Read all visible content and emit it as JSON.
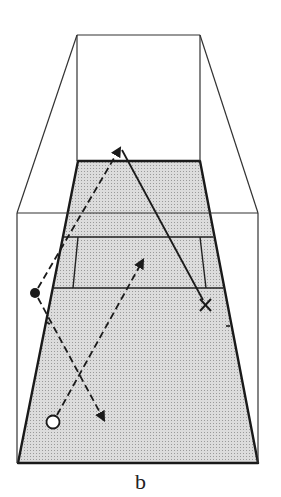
{
  "figure": {
    "caption": "b",
    "colors": {
      "line": "#1a1a1a",
      "court_fill": "#cfcfcf",
      "background": "#ffffff"
    },
    "room": {
      "back_wall": {
        "x1": 77,
        "y1": 35,
        "x2": 200,
        "y2": 35
      },
      "front_frame": {
        "left": 17,
        "top": 213,
        "right": 258,
        "bottom": 463
      }
    },
    "court": {
      "far_edge": {
        "left": 78,
        "right": 200,
        "y": 161
      },
      "near_edge": {
        "left": 18,
        "right": 258,
        "y": 463
      },
      "cross_lines_y": [
        213,
        237,
        288
      ],
      "service_box_sides": [
        [
          78,
          237,
          73,
          288
        ],
        [
          200,
          237,
          206,
          288
        ]
      ]
    },
    "players": [
      {
        "name": "filled-dot-player",
        "symbol": "●",
        "x": 35,
        "y": 293
      },
      {
        "name": "open-circle-player",
        "symbol": "○",
        "x": 53,
        "y": 422
      },
      {
        "name": "x-marker",
        "symbol": "X",
        "x": 205,
        "y": 305
      }
    ],
    "paths": [
      {
        "name": "dashed-path-dot-to-far",
        "style": "dashed",
        "from": [
          35,
          293
        ],
        "to": [
          120,
          148
        ]
      },
      {
        "name": "dashed-path-dot-to-near",
        "style": "dashed",
        "from": [
          35,
          293
        ],
        "to": [
          104,
          420
        ]
      },
      {
        "name": "dashed-path-circle-to-mid",
        "style": "dashed",
        "from": [
          53,
          422
        ],
        "to": [
          143,
          260
        ]
      },
      {
        "name": "solid-path-x-to-far",
        "style": "solid",
        "from": [
          205,
          305
        ],
        "to": [
          120,
          148
        ]
      }
    ]
  }
}
